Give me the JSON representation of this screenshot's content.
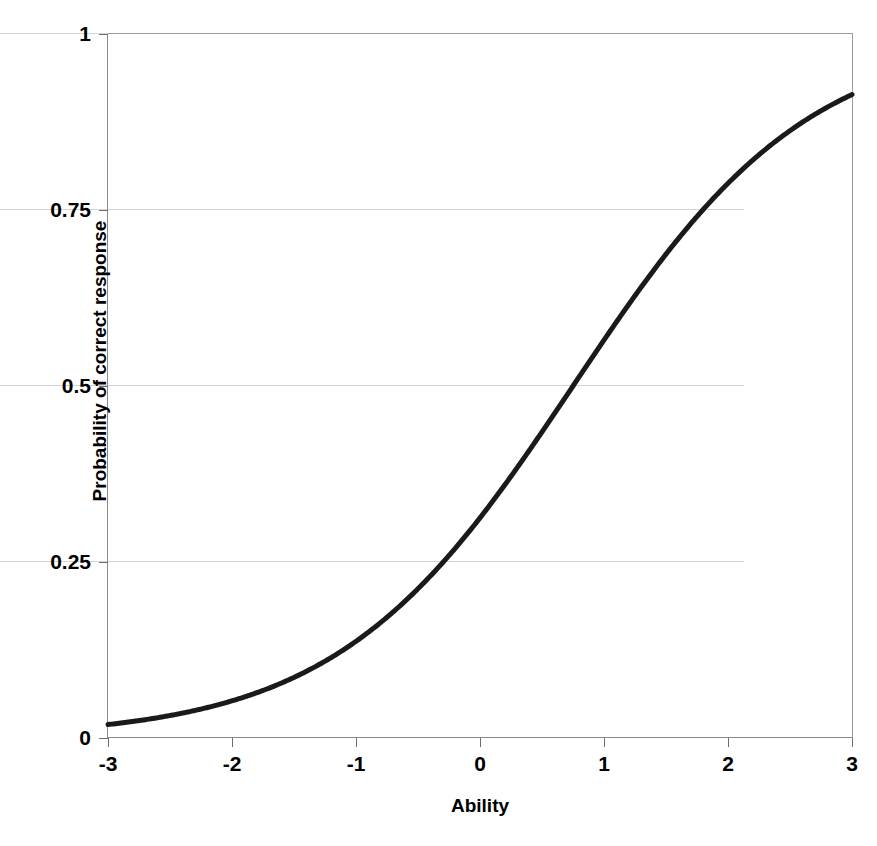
{
  "chart_data": {
    "type": "line",
    "title": "",
    "subtitle": "",
    "xlabel": "Ability",
    "ylabel": "Probability of correct response",
    "xlim": [
      -3,
      3
    ],
    "ylim": [
      0,
      1
    ],
    "xticks": [
      "-3",
      "-2",
      "-1",
      "0",
      "1",
      "2",
      "3"
    ],
    "xtick_values": [
      -3,
      -2,
      -1,
      0,
      1,
      2,
      3
    ],
    "yticks": [
      "0",
      "0.25",
      "0.5",
      "0.75",
      "1"
    ],
    "ytick_values": [
      0,
      0.25,
      0.5,
      0.75,
      1
    ],
    "grid": "horizontal",
    "legend": "none",
    "series": [
      {
        "name": "Item characteristic curve",
        "color": "#1a1a1a",
        "line_width": 5,
        "model": "2PL logistic",
        "discrimination_a": 1.05,
        "difficulty_b": 0.75,
        "x": [
          -3.0,
          -2.75,
          -2.5,
          -2.25,
          -2.0,
          -1.75,
          -1.5,
          -1.25,
          -1.0,
          -0.75,
          -0.5,
          -0.25,
          0.0,
          0.25,
          0.5,
          0.75,
          1.0,
          1.25,
          1.5,
          1.75,
          2.0,
          2.25,
          2.5,
          2.75,
          3.0
        ],
        "values": [
          0.024,
          0.031,
          0.04,
          0.052,
          0.066,
          0.085,
          0.108,
          0.137,
          0.173,
          0.215,
          0.264,
          0.321,
          0.384,
          0.451,
          0.52,
          0.589,
          0.654,
          0.714,
          0.767,
          0.812,
          0.849,
          0.879,
          0.904,
          0.924,
          0.939
        ]
      }
    ],
    "annotations": []
  },
  "axes": {
    "x_title": "Ability",
    "y_title": "Probability of correct response",
    "x_tick_labels": [
      "-3",
      "-2",
      "-1",
      "0",
      "1",
      "2",
      "3"
    ],
    "y_tick_labels": [
      "1",
      "0.75",
      "0.5",
      "0.25",
      "0"
    ]
  },
  "colors": {
    "curve": "#1a1a1a",
    "grid": "#d4d4d4",
    "axis": "#8a8a8a",
    "background": "#ffffff",
    "text": "#000000"
  }
}
